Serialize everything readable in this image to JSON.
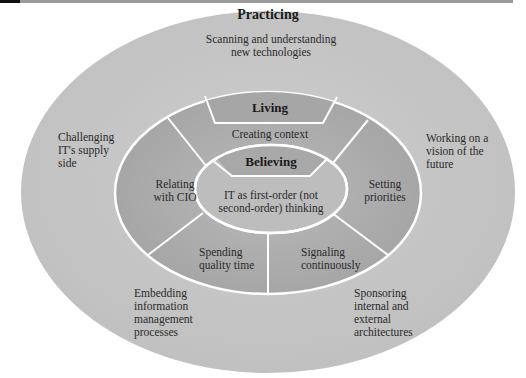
{
  "colors": {
    "outer_ring": "#c6c6c6",
    "middle_ring": "#adadad",
    "inner_core": "#bcbcbc",
    "tabs": "#a8a8a8",
    "borders": "#ffffff"
  },
  "outer": {
    "title": "Practicing",
    "top": "Scanning and understanding new technologies",
    "top_line1": "Scanning and understanding",
    "top_line2": "new technologies",
    "left": [
      "Challenging",
      "IT's supply",
      "side"
    ],
    "right": [
      "Working on a",
      "vision of the",
      "future"
    ],
    "bottom_left": [
      "Embedding",
      "information",
      "management",
      "processes"
    ],
    "bottom_right": [
      "Sponsoring",
      "internal and",
      "external",
      "architectures"
    ]
  },
  "middle": {
    "title": "Living",
    "top": "Creating context",
    "left": [
      "Relating",
      "with CIO"
    ],
    "right": [
      "Setting",
      "priorities"
    ],
    "bottom_left": [
      "Spending",
      "quality time"
    ],
    "bottom_right": [
      "Signaling",
      "continuously"
    ]
  },
  "inner": {
    "title": "Believing",
    "body": [
      "IT as first-order (not",
      "second-order) thinking"
    ]
  }
}
